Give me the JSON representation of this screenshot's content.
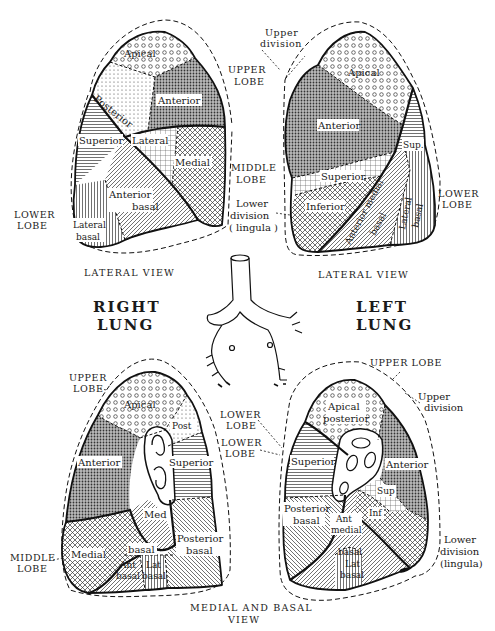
{
  "figure": {
    "type": "anatomical-diagram"
  },
  "titles": {
    "right_lung": [
      "RIGHT",
      "LUNG"
    ],
    "left_lung": [
      "LEFT",
      "LUNG"
    ]
  },
  "views": {
    "right_lateral": {
      "view_label": "LATERAL VIEW",
      "lobes": {
        "upper": [
          "UPPER",
          "LOBE"
        ],
        "middle": [
          "MIDDLE",
          "LOBE"
        ],
        "lower": [
          "LOWER",
          "LOBE"
        ]
      },
      "segments": [
        {
          "name": "Apical",
          "lobe": "upper",
          "pattern": "circles"
        },
        {
          "name": "Posterior",
          "lobe": "upper",
          "pattern": "fine-dots"
        },
        {
          "name": "Anterior",
          "lobe": "upper",
          "pattern": "dense-dots"
        },
        {
          "name": "Lateral",
          "lobe": "middle",
          "pattern": "grid"
        },
        {
          "name": "Medial",
          "lobe": "middle",
          "pattern": "crosshatch"
        },
        {
          "name": "Superior",
          "lobe": "lower",
          "pattern": "horizontal-lines"
        },
        {
          "name": "Anterior basal",
          "lobe": "lower",
          "pattern": "diagonal-lines"
        },
        {
          "name": "Lateral basal",
          "lobe": "lower",
          "pattern": "vertical-lines"
        }
      ]
    },
    "left_lateral": {
      "view_label": "LATERAL VIEW",
      "lobes": {
        "upper": [
          "UPPER",
          "LOBE"
        ],
        "upper_division": [
          "Upper",
          "division"
        ],
        "lower_division": [
          "Lower",
          "division",
          "( lingula )"
        ],
        "lower": [
          "LOWER",
          "LOBE"
        ]
      },
      "segments": [
        {
          "name": "Apical",
          "lobe": "upper",
          "pattern": "circles"
        },
        {
          "name": "Anterior",
          "lobe": "upper",
          "pattern": "dense-dots"
        },
        {
          "name": "Superior",
          "lobe": "lingula",
          "pattern": "grid"
        },
        {
          "name": "Inferior",
          "lobe": "lingula",
          "pattern": "crosshatch"
        },
        {
          "name": "Sup.",
          "lobe": "lower",
          "pattern": "horizontal-lines"
        },
        {
          "name": "Anterior medial basal",
          "lobe": "lower",
          "pattern": "diagonal-lines"
        },
        {
          "name": "Lateral basal",
          "lobe": "lower",
          "pattern": "vertical-lines"
        }
      ]
    },
    "right_medial": {
      "view_label": [
        "MEDIAL AND BASAL",
        "VIEW"
      ],
      "lobes": {
        "upper": [
          "UPPER",
          "LOBE"
        ],
        "lower": [
          "LOWER",
          "LOBE"
        ],
        "middle": [
          "MIDDLE",
          "LOBE"
        ]
      },
      "segments": [
        {
          "name": "Apical",
          "lobe": "upper",
          "pattern": "circles"
        },
        {
          "name": "Post",
          "lobe": "upper",
          "pattern": "fine-dots"
        },
        {
          "name": "Anterior",
          "lobe": "upper",
          "pattern": "dense-dots"
        },
        {
          "name": "Superior",
          "lobe": "lower",
          "pattern": "horizontal-lines"
        },
        {
          "name": "Med basal",
          "lobe": "lower",
          "pattern": "diagonal-lines"
        },
        {
          "name": "Medial",
          "lobe": "middle",
          "pattern": "crosshatch"
        },
        {
          "name": "Ant basal",
          "lobe": "lower",
          "pattern": "diagonal-lines"
        },
        {
          "name": "Lat basal",
          "lobe": "lower",
          "pattern": "vertical-lines"
        },
        {
          "name": "Posterior basal",
          "lobe": "lower",
          "pattern": "back-diagonal"
        }
      ]
    },
    "left_medial": {
      "lobes": {
        "upper": [
          "UPPER LOBE"
        ],
        "upper_division": [
          "Upper",
          "division"
        ],
        "lower": [
          "LOWER",
          "LOBE"
        ],
        "lower_division": [
          "Lower",
          "division",
          "(lingula)"
        ]
      },
      "segments": [
        {
          "name": "Apical posterior",
          "lobe": "upper",
          "pattern": "circles"
        },
        {
          "name": "Anterior",
          "lobe": "upper",
          "pattern": "dense-dots"
        },
        {
          "name": "Superior",
          "lobe": "lower",
          "pattern": "horizontal-lines"
        },
        {
          "name": "Sup",
          "lobe": "lingula",
          "pattern": "grid"
        },
        {
          "name": "Inf",
          "lobe": "lingula",
          "pattern": "crosshatch"
        },
        {
          "name": "Posterior basal",
          "lobe": "lower",
          "pattern": "back-diagonal"
        },
        {
          "name": "Ant medial basal",
          "lobe": "lower",
          "pattern": "diagonal-lines"
        },
        {
          "name": "Lat basal",
          "lobe": "lower",
          "pattern": "vertical-lines"
        }
      ]
    }
  },
  "labels": {
    "rl": {
      "apical": "Apical",
      "posterior": "Posterior",
      "anterior": "Anterior",
      "lateral": "Lateral",
      "medial": "Medial",
      "superior": "Superior",
      "anterior_basal_1": "Anterior",
      "anterior_basal_2": "basal",
      "lateral_basal_1": "Lateral",
      "lateral_basal_2": "basal",
      "upper_lobe_1": "UPPER",
      "upper_lobe_2": "LOBE",
      "middle_lobe_1": "MIDDLE",
      "middle_lobe_2": "LOBE",
      "lower_lobe_1": "LOWER",
      "lower_lobe_2": "LOBE",
      "view": "LATERAL VIEW"
    },
    "ll": {
      "upper_division_1": "Upper",
      "upper_division_2": "division",
      "apical": "Apical",
      "anterior": "Anterior",
      "sup": "Sup.",
      "superior": "Superior",
      "inferior": "Inferior",
      "anterior_medial_basal_1": "Anterior medial",
      "anterior_medial_basal_2": "basal",
      "lateral_basal_1": "Lateral",
      "lateral_basal_2": "basal",
      "lower_lobe_1": "LOWER",
      "lower_lobe_2": "LOBE",
      "lower_division_1": "Lower",
      "lower_division_2": "division",
      "lower_division_3": "( lingula )",
      "view": "LATERAL VIEW"
    },
    "rm": {
      "upper_lobe_1": "UPPER",
      "upper_lobe_2": "LOBE",
      "apical": "Apical",
      "post": "Post",
      "anterior": "Anterior",
      "superior": "Superior",
      "med": "Med",
      "basal": "basal",
      "medial": "Medial",
      "ant_1": "Ant",
      "ant_2": "basal",
      "lat_1": "Lat",
      "lat_2": "basal",
      "posterior_basal_1": "Posterior",
      "posterior_basal_2": "basal",
      "middle_lobe_1": "MIDDLE",
      "middle_lobe_2": "LOBE",
      "lower_lobe_1": "LOWER",
      "lower_lobe_2": "LOBE"
    },
    "lm": {
      "upper_lobe": "UPPER LOBE",
      "upper_division_1": "Upper",
      "upper_division_2": "division",
      "apical_1": "Apical",
      "apical_2": "posterior",
      "anterior": "Anterior",
      "superior": "Superior",
      "sup": "Sup",
      "inf": "Inf",
      "posterior_basal_1": "Posterior",
      "posterior_basal_2": "basal",
      "ant_medial_1": "Ant",
      "ant_medial_2": "medial",
      "basal": "basal",
      "lat_1": "Lat",
      "lat_2": "basal",
      "lower_division_1": "Lower",
      "lower_division_2": "division",
      "lower_division_3": "(lingula)"
    },
    "medial_view_1": "MEDIAL AND BASAL",
    "medial_view_2": "VIEW",
    "right_title_1": "RIGHT",
    "right_title_2": "LUNG",
    "left_title_1": "LEFT",
    "left_title_2": "LUNG"
  }
}
